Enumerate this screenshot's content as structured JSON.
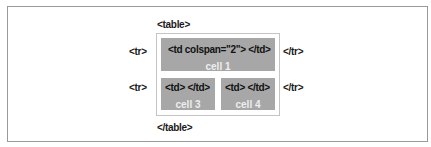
{
  "diagram": {
    "table_open": "<table>",
    "table_close": "</table>",
    "rows": [
      {
        "open": "<tr>",
        "close": "</tr>",
        "cells": [
          {
            "code": "<td colspan=\"2\"> </td>",
            "name": "cell 1"
          }
        ]
      },
      {
        "open": "<tr>",
        "close": "</tr>",
        "cells": [
          {
            "code": "<td> </td>",
            "name": "cell 3"
          },
          {
            "code": "<td> </td>",
            "name": "cell 4"
          }
        ]
      }
    ],
    "colors": {
      "cell_background": "#a7a7a7",
      "cell_label": "#eeeeee",
      "table_border": "#c4c4c4",
      "frame_border": "#9a9a9a"
    }
  }
}
